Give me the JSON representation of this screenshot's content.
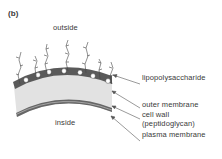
{
  "figure": {
    "panel_label": "(b)",
    "regions": {
      "outside": "outside",
      "inside": "inside"
    },
    "labels": {
      "lipopolysaccharide": "lipopolysaccharide",
      "outer_membrane": "outer membrane",
      "cell_wall_line1": "cell wall",
      "cell_wall_line2": "(peptidoglycan)",
      "plasma_membrane": "plasma membrane"
    },
    "colors": {
      "outer_membrane": "#5a5a5a",
      "cell_wall": "#e2e2e2",
      "plasma_membrane": "#666666",
      "pores": "#ffffff",
      "leader_lines": "#555555"
    }
  }
}
